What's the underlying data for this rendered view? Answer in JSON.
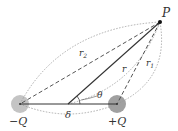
{
  "diagram": {
    "point": {
      "label": "P",
      "x": 160,
      "y": 22
    },
    "charges": [
      {
        "label": "−Q",
        "x": 20,
        "y": 104,
        "color": "#b8b8b8"
      },
      {
        "label": "+Q",
        "x": 117,
        "y": 104,
        "color": "#999999"
      }
    ],
    "midpoint": {
      "x": 68,
      "y": 104
    },
    "separation_label": "δ",
    "distances": {
      "r": "r",
      "r1": "r",
      "r1_sub": "1",
      "r2": "r",
      "r2_sub": "2"
    },
    "angle_label": "θ",
    "colors": {
      "solid_line": "#333333",
      "dashed_line": "#555555",
      "dotted_arc": "#888888",
      "label": "#333333"
    }
  }
}
